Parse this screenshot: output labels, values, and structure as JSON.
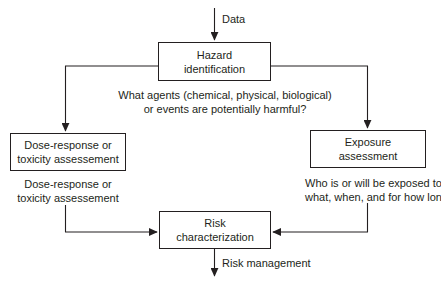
{
  "diagram": {
    "stroke_color": "#231f20",
    "background_color": "#ffffff",
    "nodes": [
      {
        "id": "hazard",
        "lines": [
          "Hazard",
          "identification"
        ]
      },
      {
        "id": "dose",
        "lines": [
          "Dose-response or",
          "toxicity assessement"
        ]
      },
      {
        "id": "exposure",
        "lines": [
          "Exposure",
          "assessment"
        ]
      },
      {
        "id": "risk",
        "lines": [
          "Risk",
          "characterization"
        ]
      }
    ],
    "captions": [
      {
        "id": "hazard_caption",
        "lines": [
          "What agents (chemical, physical, biological)",
          "or events are potentially harmful?"
        ]
      },
      {
        "id": "dose_caption",
        "lines": [
          "Dose-response or",
          "toxicity assessement"
        ]
      },
      {
        "id": "exposure_caption",
        "lines": [
          "Who is or will be exposed to",
          "what, when, and for how long?"
        ]
      }
    ],
    "edge_labels": {
      "input": "Data",
      "output": "Risk management"
    }
  }
}
